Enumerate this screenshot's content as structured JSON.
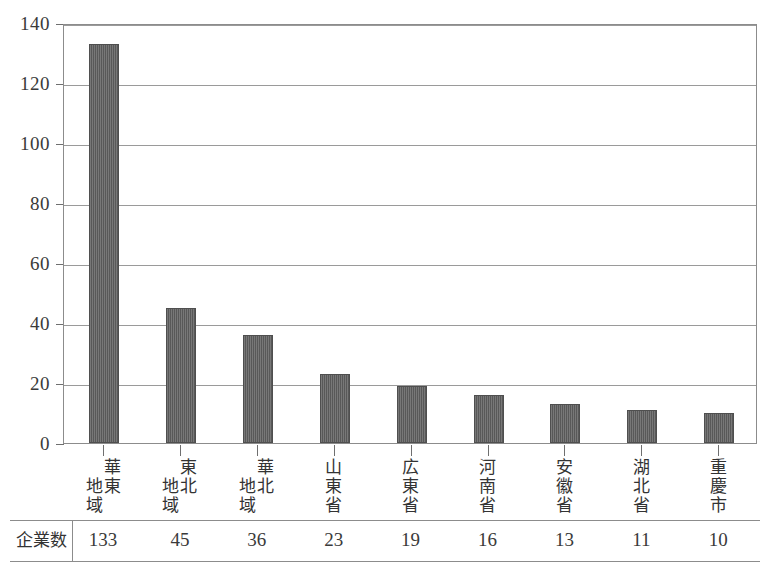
{
  "chart_data": {
    "type": "bar",
    "title": "",
    "subtitle": "",
    "xlabel": "",
    "ylabel": "",
    "categories": [
      "華東地域",
      "東北地域",
      "華北地域",
      "山東省",
      "広東省",
      "河南省",
      "安徽省",
      "湖北省",
      "重慶市"
    ],
    "category_label_columns": [
      [
        "華東",
        "地域"
      ],
      [
        "東北",
        "地域"
      ],
      [
        "華北",
        "地域"
      ],
      [
        "山東省"
      ],
      [
        "広東省"
      ],
      [
        "河南省"
      ],
      [
        "安徽省"
      ],
      [
        "湖北省"
      ],
      [
        "重慶市"
      ]
    ],
    "values": [
      133,
      45,
      36,
      23,
      19,
      16,
      13,
      11,
      10
    ],
    "ylim": [
      0,
      140
    ],
    "yticks": [
      0,
      20,
      40,
      60,
      80,
      100,
      120,
      140
    ],
    "ytick_labels": [
      "0",
      "20",
      "40",
      "60",
      "80",
      "100",
      "120",
      "140"
    ],
    "grid": true,
    "legend": false,
    "legend_position": "none",
    "bar_color": "#5e5e5e",
    "gridline_color": "#9a9a9a",
    "frame_color": "#8c8c8c"
  },
  "table": {
    "row_header": "企業数",
    "values": [
      "133",
      "45",
      "36",
      "23",
      "19",
      "16",
      "13",
      "11",
      "10"
    ]
  }
}
